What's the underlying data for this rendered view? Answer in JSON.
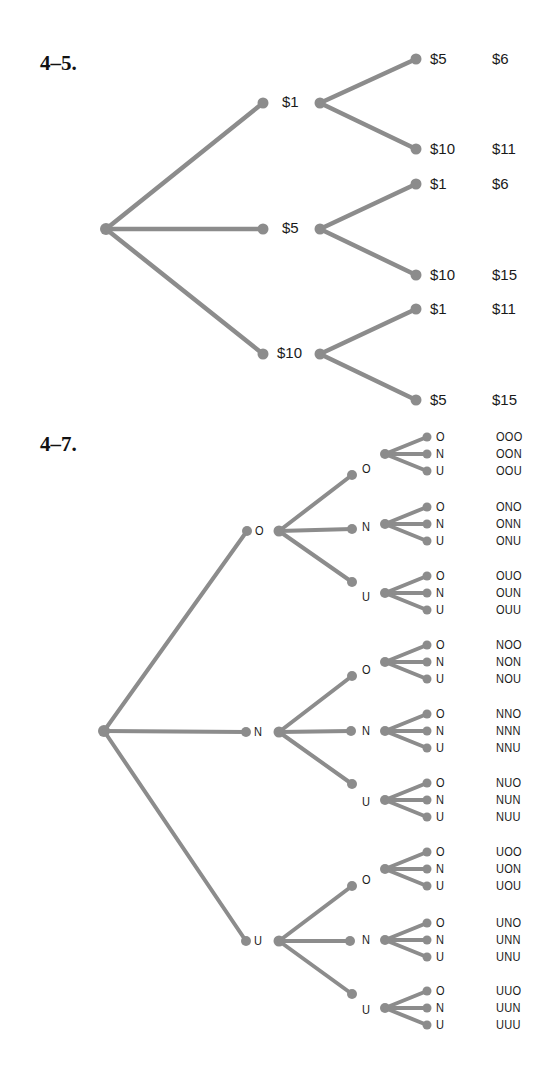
{
  "problems": [
    {
      "number": "4–5.",
      "tree": {
        "root": "",
        "level1": [
          "$1",
          "$5",
          "$10"
        ],
        "level2": [
          {
            "parent": "$1",
            "children": [
              "$5",
              "$10"
            ],
            "totals": [
              "$6",
              "$11"
            ]
          },
          {
            "parent": "$5",
            "children": [
              "$1",
              "$10"
            ],
            "totals": [
              "$6",
              "$15"
            ]
          },
          {
            "parent": "$10",
            "children": [
              "$1",
              "$5"
            ],
            "totals": [
              "$11",
              "$15"
            ]
          }
        ]
      }
    },
    {
      "number": "4–7.",
      "tree": {
        "root": "",
        "level1": [
          "O",
          "N",
          "U"
        ],
        "level2_labels": [
          "O",
          "N",
          "U"
        ],
        "level3_labels": [
          "O",
          "N",
          "U"
        ],
        "outcomes": [
          "OOO",
          "OON",
          "OOU",
          "ONO",
          "ONN",
          "ONU",
          "OUO",
          "OUN",
          "OUU",
          "NOO",
          "NON",
          "NOU",
          "NNO",
          "NNN",
          "NNU",
          "NUO",
          "NUN",
          "NUU",
          "UOO",
          "UON",
          "UOU",
          "UNO",
          "UNN",
          "UNU",
          "UUO",
          "UUN",
          "UUU"
        ]
      }
    }
  ],
  "colors": {
    "branch": "#8c8c8c",
    "text": "#1a1a1a"
  }
}
